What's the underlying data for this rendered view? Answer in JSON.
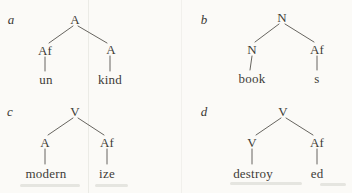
{
  "figure": {
    "description_type": "morphology-tree-diagrams",
    "trees": [
      {
        "label": "a",
        "root": "A",
        "left": "Af",
        "right": "A",
        "left_word": "un",
        "right_word": "kind"
      },
      {
        "label": "b",
        "root": "N",
        "left": "N",
        "right": "Af",
        "left_word": "book",
        "right_word": "s"
      },
      {
        "label": "c",
        "root": "V",
        "left": "A",
        "right": "Af",
        "left_word": "modern",
        "right_word": "ize"
      },
      {
        "label": "d",
        "root": "V",
        "left": "V",
        "right": "Af",
        "left_word": "destroy",
        "right_word": "ed"
      }
    ],
    "colors": {
      "background": "#fbfaf7",
      "text": "#3e3c37",
      "edge": "#56544e",
      "scan_rule": "#ebebe6"
    }
  }
}
